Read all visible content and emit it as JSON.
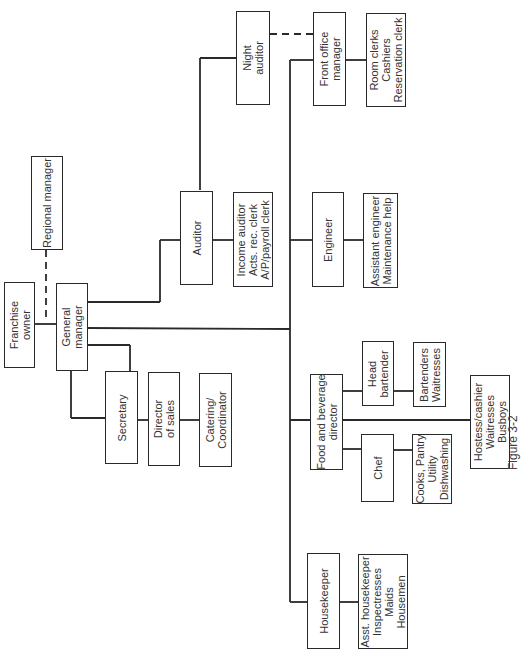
{
  "chart": {
    "orientation": "rotated 90 degrees counter-clockwise",
    "nodes": {
      "franchise_owner": "Franchise\nowner",
      "regional_manager": "Regional manager",
      "general_manager": "General\nmanager",
      "secretary": "Secretary",
      "director_of_sales": "Director\nof sales",
      "catering_coordinator": "Catering/\nCoordinator",
      "auditor": "Auditor",
      "auditor_staff": "Income auditor\nActs. rec. clerk\nA/P/payroll clerk",
      "night_auditor": "Night\nauditor",
      "front_office_manager": "Front office\nmanager",
      "front_office_staff": "Room clerks\nCashiers\nReservation clerk",
      "engineer": "Engineer",
      "engineer_staff": "Assistant engineer\nMaintenance help",
      "food_beverage_director": "Food and beverage\ndirector",
      "head_bartender": "Head\nbartender",
      "bar_staff": "Bartenders\nWaitresses",
      "chef": "Chef",
      "kitchen_staff": "Cooks, Pantry\nUtility\nDishwashing",
      "dining_staff": "Hostess/cashier\nWaitresses\nBusboys",
      "housekeeper": "Housekeeper",
      "housekeeping_staff": "Asst. housekeeper\nInspectresses\nMaids\nHousemen"
    },
    "edges": [
      [
        "franchise_owner",
        "general_manager",
        "solid"
      ],
      [
        "regional_manager",
        "general_manager",
        "dashed"
      ],
      [
        "general_manager",
        "secretary",
        "solid"
      ],
      [
        "general_manager",
        "director_of_sales",
        "solid"
      ],
      [
        "director_of_sales",
        "catering_coordinator",
        "solid"
      ],
      [
        "general_manager",
        "auditor",
        "solid"
      ],
      [
        "auditor",
        "auditor_staff",
        "solid"
      ],
      [
        "auditor",
        "night_auditor",
        "solid"
      ],
      [
        "night_auditor",
        "front_office_manager",
        "dashed"
      ],
      [
        "general_manager",
        "front_office_manager",
        "solid"
      ],
      [
        "front_office_manager",
        "front_office_staff",
        "solid"
      ],
      [
        "general_manager",
        "engineer",
        "solid"
      ],
      [
        "engineer",
        "engineer_staff",
        "solid"
      ],
      [
        "general_manager",
        "food_beverage_director",
        "solid"
      ],
      [
        "food_beverage_director",
        "head_bartender",
        "solid"
      ],
      [
        "head_bartender",
        "bar_staff",
        "solid"
      ],
      [
        "food_beverage_director",
        "chef",
        "solid"
      ],
      [
        "chef",
        "kitchen_staff",
        "solid"
      ],
      [
        "food_beverage_director",
        "dining_staff",
        "solid"
      ],
      [
        "general_manager",
        "housekeeper",
        "solid"
      ],
      [
        "housekeeper",
        "housekeeping_staff",
        "solid"
      ]
    ],
    "caption": "Figure 3-2"
  }
}
